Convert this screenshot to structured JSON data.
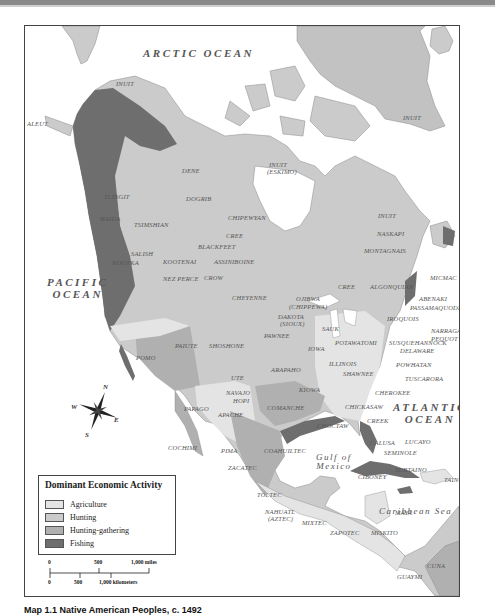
{
  "map": {
    "title": "Map 1.1 Native American Peoples, c. 1492",
    "colors": {
      "agriculture": "#e4e4e4",
      "hunting": "#cbcbcb",
      "hunting_gathering": "#b0b0b0",
      "fishing": "#6e6e6e",
      "water": "#ffffff",
      "border": "#444444"
    },
    "oceans": {
      "arctic": "ARCTIC OCEAN",
      "pacific_line1": "PACIFIC",
      "pacific_line2": "OCEAN",
      "atlantic_line1": "ATLANTIC",
      "atlantic_line2": "OCEAN",
      "gulf_line1": "Gulf of",
      "gulf_line2": "Mexico",
      "caribbean": "Caribbean Sea"
    },
    "peoples": [
      {
        "name": "INUIT",
        "x": 91,
        "y": 55
      },
      {
        "name": "ALEUT",
        "x": 2,
        "y": 95
      },
      {
        "name": "INUIT",
        "x": 378,
        "y": 89
      },
      {
        "name": "INUIT",
        "x": 244,
        "y": 136
      },
      {
        "name": "(ESKIMO)",
        "x": 242,
        "y": 143
      },
      {
        "name": "DENE",
        "x": 157,
        "y": 142
      },
      {
        "name": "DOGRIB",
        "x": 161,
        "y": 170
      },
      {
        "name": "CHIPEWYAN",
        "x": 203,
        "y": 189
      },
      {
        "name": "TLINGIT",
        "x": 79,
        "y": 168
      },
      {
        "name": "HAIDA",
        "x": 75,
        "y": 190
      },
      {
        "name": "TSIMSHIAN",
        "x": 109,
        "y": 196
      },
      {
        "name": "CREE",
        "x": 201,
        "y": 207
      },
      {
        "name": "BLACKFEET",
        "x": 173,
        "y": 218
      },
      {
        "name": "SALISH",
        "x": 106,
        "y": 225
      },
      {
        "name": "KOOTENAI",
        "x": 138,
        "y": 233
      },
      {
        "name": "ASSINIBOINE",
        "x": 189,
        "y": 233
      },
      {
        "name": "NOOTKA",
        "x": 87,
        "y": 234
      },
      {
        "name": "NEZ PERCE",
        "x": 138,
        "y": 250
      },
      {
        "name": "CROW",
        "x": 179,
        "y": 249
      },
      {
        "name": "INUIT",
        "x": 353,
        "y": 187
      },
      {
        "name": "NASKAPI",
        "x": 352,
        "y": 205
      },
      {
        "name": "MONTAGNAIS",
        "x": 339,
        "y": 222
      },
      {
        "name": "BEOTHUK",
        "x": 437,
        "y": 229
      },
      {
        "name": "CREE",
        "x": 313,
        "y": 258
      },
      {
        "name": "ALGONQUIAN",
        "x": 345,
        "y": 258
      },
      {
        "name": "MICMAC",
        "x": 405,
        "y": 249
      },
      {
        "name": "OJIBWA",
        "x": 271,
        "y": 270
      },
      {
        "name": "(CHIPPEWA)",
        "x": 264,
        "y": 278
      },
      {
        "name": "ABENAKI",
        "x": 394,
        "y": 270
      },
      {
        "name": "PASSAMAQUODDY",
        "x": 385,
        "y": 279
      },
      {
        "name": "CHEYENNE",
        "x": 207,
        "y": 269
      },
      {
        "name": "DAKOTA",
        "x": 253,
        "y": 288
      },
      {
        "name": "(SIOUX)",
        "x": 255,
        "y": 295
      },
      {
        "name": "SAUK",
        "x": 297,
        "y": 300
      },
      {
        "name": "IROQUOIS",
        "x": 362,
        "y": 290
      },
      {
        "name": "NARRAGANSETT",
        "x": 406,
        "y": 302
      },
      {
        "name": "PEQUOT",
        "x": 406,
        "y": 310
      },
      {
        "name": "PAWNEE",
        "x": 239,
        "y": 307
      },
      {
        "name": "POTAWATOMI",
        "x": 310,
        "y": 314
      },
      {
        "name": "SUSQUEHANNOCK",
        "x": 364,
        "y": 314
      },
      {
        "name": "DELAWARE",
        "x": 375,
        "y": 322
      },
      {
        "name": "PAIUTE",
        "x": 150,
        "y": 317
      },
      {
        "name": "SHOSHONE",
        "x": 184,
        "y": 317
      },
      {
        "name": "IOWA",
        "x": 283,
        "y": 320
      },
      {
        "name": "POMO",
        "x": 111,
        "y": 329
      },
      {
        "name": "ILLINOIS",
        "x": 304,
        "y": 335
      },
      {
        "name": "POWHATAN",
        "x": 371,
        "y": 336
      },
      {
        "name": "SHAWNEE",
        "x": 318,
        "y": 345
      },
      {
        "name": "ARAPAHO",
        "x": 246,
        "y": 341
      },
      {
        "name": "TUSCARORA",
        "x": 380,
        "y": 350
      },
      {
        "name": "UTE",
        "x": 206,
        "y": 349
      },
      {
        "name": "KIOWA",
        "x": 274,
        "y": 361
      },
      {
        "name": "NAVAJO",
        "x": 201,
        "y": 364
      },
      {
        "name": "HOPI",
        "x": 208,
        "y": 372
      },
      {
        "name": "CHEROKEE",
        "x": 350,
        "y": 364
      },
      {
        "name": "PAPAGO",
        "x": 159,
        "y": 380
      },
      {
        "name": "COMANCHE",
        "x": 242,
        "y": 379
      },
      {
        "name": "APACHE",
        "x": 193,
        "y": 386
      },
      {
        "name": "CHICKASAW",
        "x": 320,
        "y": 378
      },
      {
        "name": "CREEK",
        "x": 342,
        "y": 392
      },
      {
        "name": "CHOCTAW",
        "x": 292,
        "y": 397
      },
      {
        "name": "COCHIMI",
        "x": 143,
        "y": 419
      },
      {
        "name": "PIMA",
        "x": 196,
        "y": 422
      },
      {
        "name": "COAHUILTEC",
        "x": 239,
        "y": 422
      },
      {
        "name": "CALUSA",
        "x": 345,
        "y": 414
      },
      {
        "name": "LUCAYO",
        "x": 380,
        "y": 413
      },
      {
        "name": "SEMINOLE",
        "x": 359,
        "y": 424
      },
      {
        "name": "ZACATEC",
        "x": 203,
        "y": 439
      },
      {
        "name": "CIBONEY",
        "x": 333,
        "y": 448
      },
      {
        "name": "SUBTAINO",
        "x": 370,
        "y": 441
      },
      {
        "name": "TAINO",
        "x": 419,
        "y": 451
      },
      {
        "name": "TOLTEC",
        "x": 232,
        "y": 466
      },
      {
        "name": "MAYA",
        "x": 370,
        "y": 484
      },
      {
        "name": "NAHUATL",
        "x": 240,
        "y": 483
      },
      {
        "name": "(AZTEC)",
        "x": 243,
        "y": 490
      },
      {
        "name": "MIXTEC",
        "x": 277,
        "y": 494
      },
      {
        "name": "ZAPOTEC",
        "x": 305,
        "y": 504
      },
      {
        "name": "MISKITO",
        "x": 346,
        "y": 504
      },
      {
        "name": "CUNA",
        "x": 402,
        "y": 537
      },
      {
        "name": "GUAYMI",
        "x": 372,
        "y": 548
      }
    ]
  },
  "legend": {
    "title": "Dominant Economic Activity",
    "items": [
      {
        "label": "Agriculture",
        "color": "#e4e4e4"
      },
      {
        "label": "Hunting",
        "color": "#cbcbcb"
      },
      {
        "label": "Hunting-gathering",
        "color": "#b0b0b0"
      },
      {
        "label": "Fishing",
        "color": "#6e6e6e"
      }
    ]
  },
  "scale": {
    "miles": {
      "zero": "0",
      "mid": "500",
      "max": "1,000 miles"
    },
    "km": {
      "zero": "0",
      "mid": "500",
      "max": "1,000 kilometers"
    }
  },
  "compass": {
    "n": "N",
    "s": "S",
    "e": "E",
    "w": "W"
  }
}
